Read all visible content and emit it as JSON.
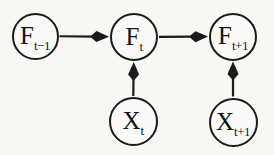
{
  "diagram": {
    "kind": "temporal-graphical-model",
    "background": "#f8f7f4",
    "stroke_color": "#1b1b1b",
    "node_fill": "#fbfaf8",
    "nodes": [
      {
        "id": "F_t-1",
        "main": "F",
        "sub": "t−1",
        "cx": 35,
        "cy": 36,
        "r": 23.5
      },
      {
        "id": "F_t",
        "main": "F",
        "sub": "t",
        "cx": 134,
        "cy": 37,
        "r": 24
      },
      {
        "id": "F_t+1",
        "main": "F",
        "sub": "t+1",
        "cx": 233,
        "cy": 36.5,
        "r": 24
      },
      {
        "id": "X_t",
        "main": "X",
        "sub": "t",
        "cx": 133,
        "cy": 121.5,
        "r": 24.5
      },
      {
        "id": "X_t+1",
        "main": "X",
        "sub": "t+1",
        "cx": 233,
        "cy": 122,
        "r": 24.5
      }
    ],
    "edges": [
      {
        "from": "F_t-1",
        "to": "F_t"
      },
      {
        "from": "F_t",
        "to": "F_t+1"
      },
      {
        "from": "X_t",
        "to": "F_t"
      },
      {
        "from": "X_t+1",
        "to": "F_t+1"
      }
    ]
  }
}
